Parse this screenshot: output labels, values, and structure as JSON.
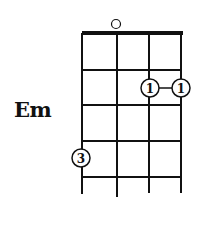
{
  "chord": {
    "name": "Em",
    "instrument_strings": 4,
    "frets_shown": 4,
    "open_strings": [
      2
    ],
    "fingering": [
      {
        "string": 3,
        "fret": 2,
        "finger": "1"
      },
      {
        "string": 4,
        "fret": 2,
        "finger": "1"
      },
      {
        "string": 1,
        "fret": 4,
        "finger": "3"
      }
    ],
    "barre": {
      "fret": 2,
      "from_string": 3,
      "to_string": 4
    }
  },
  "colors": {
    "ink": "#111111",
    "background": "#ffffff"
  }
}
